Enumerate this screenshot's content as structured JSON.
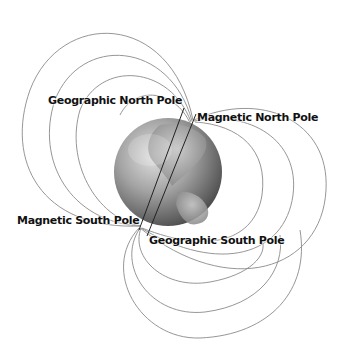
{
  "diagram": {
    "labels": {
      "geographic_north": "Geographic North Pole",
      "magnetic_north": "Magnetic North Pole",
      "magnetic_south": "Magnetic South Pole",
      "geographic_south": "Geographic South Pole"
    },
    "colors": {
      "background": "#ffffff",
      "field_line": "#8a8a8a",
      "axis_line": "#222222",
      "text": "#111111",
      "globe_light": "#d9d9d9",
      "globe_mid": "#8c8c8c",
      "globe_dark": "#3c3c3c"
    }
  }
}
